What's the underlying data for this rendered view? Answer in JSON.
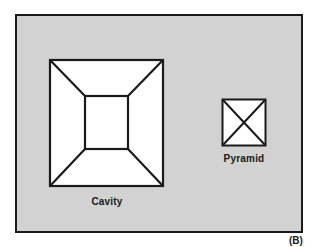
{
  "figure": {
    "tag": "(B)",
    "background_color": "#d2d2d2",
    "line_color": "#1a1a1a",
    "shapes": [
      {
        "name": "Cavity",
        "label": "Cavity",
        "type": "frustum-top-view",
        "outer": [
          50,
          60,
          163,
          186
        ],
        "inner": [
          85,
          96,
          128,
          149
        ]
      },
      {
        "name": "Pyramid",
        "label": "Pyramid",
        "type": "pyramid-top-view",
        "outer": [
          222,
          99,
          266,
          145
        ]
      }
    ]
  }
}
